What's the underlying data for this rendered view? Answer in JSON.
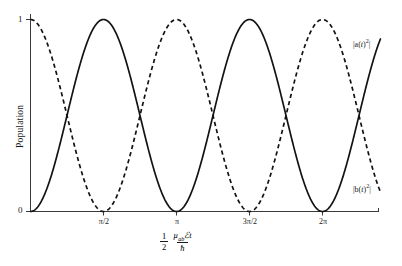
{
  "chart_data": {
    "type": "line",
    "title": "",
    "xlabel": "1/2 µ_ab ℰ t / ħ",
    "ylabel": "Population",
    "xlim": [
      0,
      7.53
    ],
    "ylim": [
      0,
      1
    ],
    "grid": false,
    "legend_position": "inline-right",
    "x_tick_values": [
      1.5708,
      3.1416,
      4.7124,
      6.2832
    ],
    "x_tick_labels": [
      "π/2",
      "π",
      "3π/2",
      "2π"
    ],
    "y_tick_values": [
      0,
      1
    ],
    "y_tick_labels": [
      "0",
      "1"
    ],
    "series": [
      {
        "name": "|a(t)²|",
        "style": "solid",
        "formula": "sin^2(x)",
        "color": "#131313",
        "x": [
          0,
          0.3927,
          0.7854,
          1.1781,
          1.5708,
          1.9635,
          2.3562,
          2.7489,
          3.1416,
          3.5343,
          3.927,
          4.3197,
          4.7124,
          5.1051,
          5.4978,
          5.8905,
          6.2832,
          6.6759,
          7.0686,
          7.4613,
          7.53
        ],
        "y": [
          0,
          0.1464,
          0.5,
          0.8536,
          1,
          0.8536,
          0.5,
          0.1464,
          0,
          0.1464,
          0.5,
          0.8536,
          1,
          0.8536,
          0.5,
          0.1464,
          0,
          0.1464,
          0.5,
          0.8536,
          0.8742
        ]
      },
      {
        "name": "|b(t)²|",
        "style": "dashed",
        "formula": "cos^2(x)",
        "color": "#131313",
        "x": [
          0,
          0.3927,
          0.7854,
          1.1781,
          1.5708,
          1.9635,
          2.3562,
          2.7489,
          3.1416,
          3.5343,
          3.927,
          4.3197,
          4.7124,
          5.1051,
          5.4978,
          5.8905,
          6.2832,
          6.6759,
          7.0686,
          7.4613,
          7.53
        ],
        "y": [
          1,
          0.8536,
          0.5,
          0.1464,
          0,
          0.1464,
          0.5,
          0.8536,
          1,
          0.8536,
          0.5,
          0.1464,
          0,
          0.1464,
          0.5,
          0.8536,
          1,
          0.8536,
          0.5,
          0.1464,
          0.1258
        ]
      }
    ],
    "annotations": [
      {
        "text": "|a(t)²|",
        "series": "|a(t)²|"
      },
      {
        "text": "|b(t)²|",
        "series": "|b(t)²|"
      }
    ]
  },
  "axes": {
    "y_title": "Population",
    "y_ticks": [
      {
        "label": "1",
        "value": 1
      },
      {
        "label": "0",
        "value": 0
      }
    ],
    "x_ticks": [
      {
        "label": "π/2",
        "value": 1.5708
      },
      {
        "label": "π",
        "value": 3.1416
      },
      {
        "label": "3π/2",
        "value": 4.7124
      },
      {
        "label": "2π",
        "value": 6.2832
      }
    ],
    "x_title": {
      "coefficient_numerator": "1",
      "coefficient_denominator": "2",
      "numerator_symbol": "µ",
      "numerator_subscript": "ab",
      "field_symbol": "ℰ",
      "time_symbol": "t",
      "denominator_symbol": "ħ"
    }
  },
  "series_labels": {
    "upper": {
      "base": "|a(",
      "var": "t",
      "close": ")",
      "exp": "2",
      "tail": "|"
    },
    "lower": {
      "base": "|b(",
      "var": "t",
      "close": ")",
      "exp": "2",
      "tail": "|"
    }
  },
  "colors": {
    "curve": "#131313",
    "axis": "#3a3a3a",
    "background": "#ffffff",
    "text": "#1a1a1a"
  }
}
